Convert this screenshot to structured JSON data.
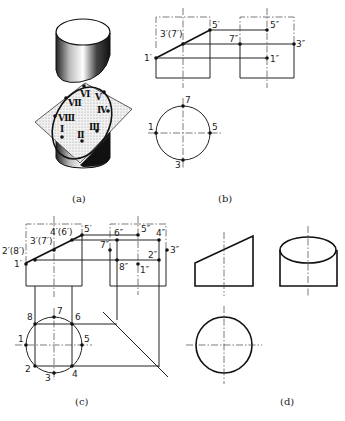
{
  "figure": {
    "panels": [
      {
        "id": "a",
        "caption": "(a)",
        "description": "Isometric cylinder cut by an inclined plane, section ellipse with points I–VIII"
      },
      {
        "id": "b",
        "caption": "(b)",
        "description": "Front, side and top views with special points 1,3,5,7"
      },
      {
        "id": "c",
        "caption": "(c)",
        "description": "Projection construction with points 1–8 and 45° miter line"
      },
      {
        "id": "d",
        "caption": "(d)",
        "description": "Finished three views of the truncated cylinder"
      }
    ]
  },
  "panel_a": {
    "caption": "(a)",
    "roman_labels": [
      "Ⅰ",
      "Ⅱ",
      "Ⅲ",
      "Ⅳ",
      "Ⅴ",
      "Ⅵ",
      "Ⅶ",
      "Ⅷ"
    ]
  },
  "panel_b": {
    "caption": "(b)",
    "front_labels": {
      "p1": "1′",
      "p37": "3′(7′)",
      "p5": "5′"
    },
    "side_labels": {
      "p5": "5″",
      "p7": "7″",
      "p3": "3″",
      "p1": "1″"
    },
    "top_labels": {
      "p1": "1",
      "p3": "3",
      "p5": "5",
      "p7": "7"
    }
  },
  "panel_c": {
    "caption": "(c)",
    "front_labels": {
      "p1": "1′",
      "p28": "2′(8′)",
      "p37": "3′(7′)",
      "p46": "4′(6′)",
      "p5": "5′"
    },
    "side_labels": {
      "p6": "6″",
      "p5": "5″",
      "p4": "4″",
      "p7": "7″",
      "p3": "3″",
      "p2": "2″",
      "p8": "8″",
      "p1": "1″"
    },
    "top_labels": {
      "p1": "1",
      "p2": "2",
      "p3": "3",
      "p4": "4",
      "p5": "5",
      "p6": "6",
      "p7": "7",
      "p8": "8"
    }
  },
  "panel_d": {
    "caption": "(d)"
  }
}
